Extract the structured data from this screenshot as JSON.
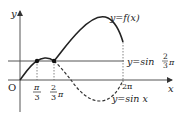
{
  "diagram": {
    "y_axis_label": "y",
    "x_axis_label": "x",
    "origin_label": "O",
    "tick_pi_over_3": {
      "num": "π",
      "den": "3"
    },
    "tick_2pi_over_3": {
      "num": "2",
      "den": "3",
      "suffix": "π"
    },
    "tick_2pi": "2π",
    "curve_f_label": "y=f(x)",
    "line_label_prefix": "y=sin",
    "line_label_num": "2",
    "line_label_den": "3",
    "line_label_suffix": "π",
    "curve_sin_label": "y=sin x",
    "colors": {
      "ink": "#222222",
      "axis": "#333333",
      "dashed": "#333333"
    }
  }
}
